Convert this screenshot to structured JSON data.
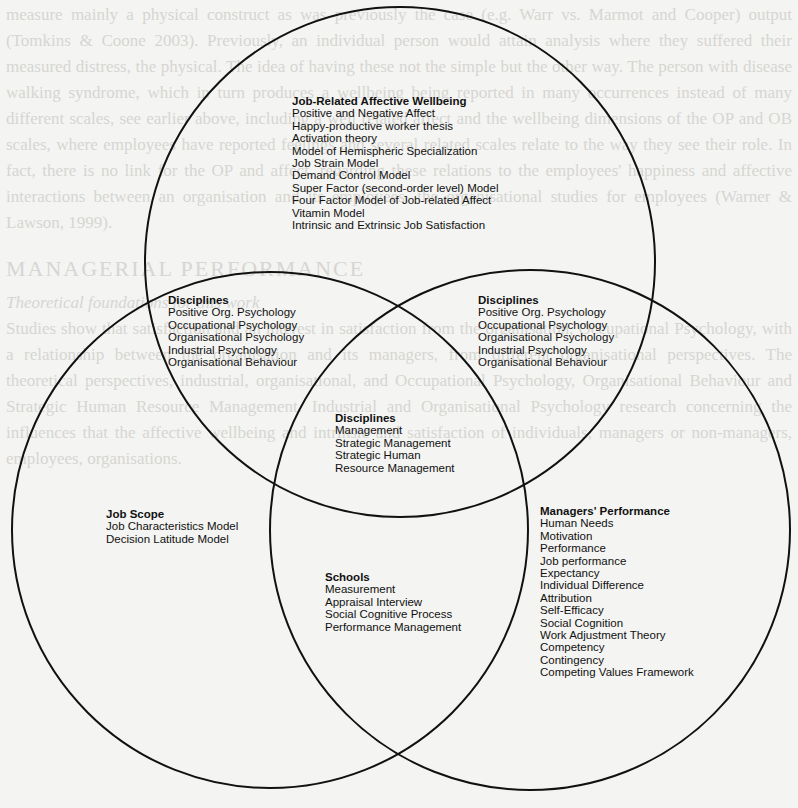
{
  "diagram": {
    "type": "venn",
    "circles": [
      {
        "name": "top",
        "cx": 400,
        "cy": 262,
        "r": 255
      },
      {
        "name": "bottom-left",
        "cx": 270,
        "cy": 530,
        "r": 258
      },
      {
        "name": "bottom-right",
        "cx": 530,
        "cy": 530,
        "r": 260
      }
    ],
    "stroke_color": "#111111"
  },
  "regions": {
    "top_only": {
      "title": "Job-Related Affective Wellbeing",
      "items": [
        "Positive and Negative Affect",
        "Happy-productive worker thesis",
        "Activation theory",
        "Model of Hemispheric Specialization",
        "Job Strain Model",
        "Demand Control Model",
        "Super Factor (second-order level) Model",
        "Four Factor Model of Job-related Affect",
        "Vitamin Model",
        "Intrinsic and Extrinsic Job Satisfaction"
      ]
    },
    "top_left_overlap": {
      "title": "Disciplines",
      "items": [
        "Positive Org. Psychology",
        "Occupational Psychology",
        "Organisational Psychology",
        "Industrial Psychology",
        "Organisational Behaviour"
      ]
    },
    "top_right_overlap": {
      "title": "Disciplines",
      "items": [
        "Positive Org. Psychology",
        "Occupational Psychology",
        "Organisational Psychology",
        "Industrial Psychology",
        "Organisational Behaviour"
      ]
    },
    "center": {
      "title": "Disciplines",
      "items": [
        "Management",
        "Strategic Management",
        "Strategic Human",
        "Resource Management"
      ]
    },
    "left_only": {
      "title": "Job Scope",
      "items": [
        "Job Characteristics Model",
        "Decision Latitude Model"
      ]
    },
    "bottom_overlap": {
      "title": "Schools",
      "items": [
        "Measurement",
        "Appraisal Interview",
        "Social Cognitive Process",
        "Performance Management"
      ]
    },
    "right_only": {
      "title": "Managers' Performance",
      "items": [
        "Human Needs",
        "Motivation",
        "Performance",
        "Job performance",
        "Expectancy",
        "Individual Difference",
        "Attribution",
        "Self-Efficacy",
        "Social Cognition",
        "Work Adjustment Theory",
        "Competency",
        "Contingency",
        "Competing Values Framework"
      ]
    }
  },
  "background_text": {
    "paragraphs": [
      "measure mainly a physical construct as was previously the case (e.g. Warr vs. Marmot and Cooper) output (Tomkins & Coone 2003). Previously, an individual person would attain analysis where they suffered their measured distress, the physical. The idea of having these not the simple but the other way. The person with disease walking syndrome, which in turn produces a wellbeing being reported in many occurrences instead of many different scales, see earlier above, including a well related affect and the wellbeing dimensions of the OP and OB scales, where employees have reported feelings and several related scales relate to the way they see their role. In fact, there is no link for the OP and affect, regarding these relations to the employees' happiness and affective interactions between an organisation and its employees, the organisational studies for employees (Warner & Lawson, 1999).",
      "MANAGERIAL PERFORMANCE",
      "Theoretical foundations for this work",
      "Studies show that satisfaction and an interest in satisfaction from the organisation, Occupational Psychology, with a relationship between the organisation and its managers, from different organisational perspectives. The theoretical perspectives, industrial, organisational, and Occupational Psychology, Organisational Behaviour and Strategic Human Resource Management. Industrial and Organisational Psychology research concerning the influences that the affective wellbeing and intrinsic and satisfaction of individuals, managers or non-managers, employees, organisations."
    ]
  }
}
